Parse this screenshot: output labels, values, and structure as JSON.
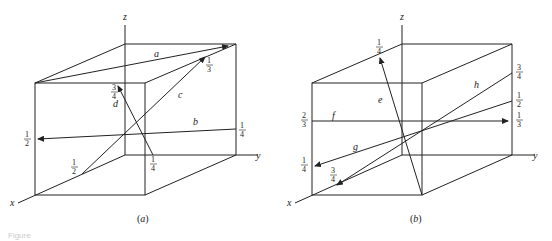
{
  "figure": {
    "caption_partial": "Figure",
    "panels": [
      {
        "id": "a",
        "label": "(a)",
        "axes": {
          "x": "x",
          "y": "y",
          "z": "z"
        },
        "vectors": [
          {
            "name": "a"
          },
          {
            "name": "b",
            "start_label": "1/4",
            "end_label": "1/2"
          },
          {
            "name": "c",
            "start_label": "1/2",
            "end_label": "1/3"
          },
          {
            "name": "d",
            "start_label": "1/4",
            "end_label": "3/4"
          }
        ]
      },
      {
        "id": "b",
        "label": "(b)",
        "axes": {
          "x": "x",
          "y": "y",
          "z": "z"
        },
        "vectors": [
          {
            "name": "e",
            "end_label": "1/4"
          },
          {
            "name": "f",
            "start_label": "2/3",
            "end_label": "1/3"
          },
          {
            "name": "g",
            "start_label": "1/2",
            "end_label": "1/4"
          },
          {
            "name": "h",
            "start_label": "3/4",
            "end_label": "3/4"
          }
        ]
      }
    ]
  }
}
